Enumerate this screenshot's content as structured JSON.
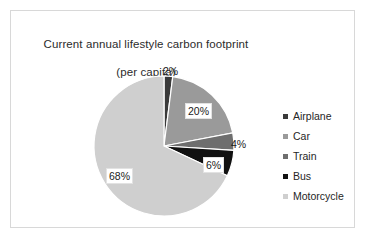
{
  "chart_data": {
    "type": "pie",
    "title": "Current annual lifestyle carbon footprint\n(per capita)",
    "title_line1": "Current annual lifestyle carbon footprint",
    "title_line2": "(per capita)",
    "categories": [
      "Airplane",
      "Car",
      "Train",
      "Bus",
      "Motorcycle"
    ],
    "values": [
      2,
      20,
      4,
      6,
      68
    ],
    "value_labels": [
      "2%",
      "20%",
      "4%",
      "6%",
      "68%"
    ],
    "unit": "%",
    "colors": [
      "#3a3a3a",
      "#9a9a9a",
      "#6e6e6e",
      "#111111",
      "#cfcfcf"
    ],
    "legend_position": "right",
    "start_angle_deg": 0,
    "direction": "clockwise",
    "xlabel": "",
    "ylabel": "",
    "grid": false
  },
  "labels": [
    {
      "text": "2%",
      "boxed": false,
      "left": 84,
      "top": 4
    },
    {
      "text": "20%",
      "boxed": true,
      "left": 106,
      "top": 42
    },
    {
      "text": "4%",
      "boxed": false,
      "left": 152,
      "top": 77
    },
    {
      "text": "6%",
      "boxed": true,
      "left": 124,
      "top": 96
    },
    {
      "text": "68%",
      "boxed": true,
      "left": 27,
      "top": 107
    }
  ],
  "legend": {
    "items": [
      {
        "label": "Airplane",
        "color": "#3a3a3a"
      },
      {
        "label": "Car",
        "color": "#9a9a9a"
      },
      {
        "label": "Train",
        "color": "#6e6e6e"
      },
      {
        "label": "Bus",
        "color": "#111111"
      },
      {
        "label": "Motorcycle",
        "color": "#cfcfcf"
      }
    ]
  }
}
